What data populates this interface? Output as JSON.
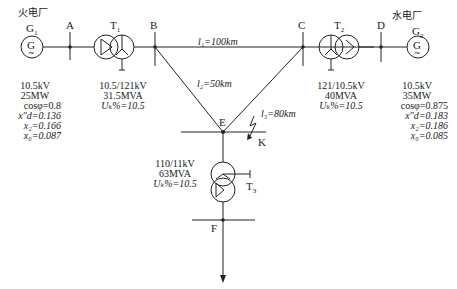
{
  "plants": {
    "thermal": {
      "label": "火电厂",
      "gen": "G",
      "gen_sub": "1",
      "symbol": "G"
    },
    "hydro": {
      "label": "水电厂",
      "gen": "G",
      "gen_sub": "2",
      "symbol": "G"
    }
  },
  "buses": {
    "A": "A",
    "B": "B",
    "C": "C",
    "D": "D",
    "E": "E",
    "F": "F"
  },
  "transformers": {
    "T1": {
      "name": "T",
      "sub": "1",
      "ratio": "10.5/121kV",
      "rating": "31.5MVA",
      "uk": "Uₖ%=10.5"
    },
    "T2": {
      "name": "T",
      "sub": "2",
      "ratio": "121/10.5kV",
      "rating": "40MVA",
      "uk": "Uₖ%=10.5"
    },
    "T3": {
      "name": "T",
      "sub": "3",
      "ratio": "110/11kV",
      "rating": "63MVA",
      "uk": "Uₖ%=10.5"
    }
  },
  "generators": {
    "G1": {
      "voltage": "10.5kV",
      "power": "25MW",
      "cos": "cosφ=0.8",
      "xd": "x″d=0.136",
      "x2": "x₂=0.166",
      "x0": "x₀=0.087"
    },
    "G2": {
      "voltage": "10.5kV",
      "power": "35MW",
      "cos": "cosφ=0.875",
      "xd": "x″d=0.183",
      "x2": "x₂=0.186",
      "x0": "x₀=0.085"
    }
  },
  "lines": {
    "l1": "l₁=100km",
    "l2": "l₂=50km",
    "l3": "l₃=80km"
  },
  "fault": {
    "label": "K"
  }
}
